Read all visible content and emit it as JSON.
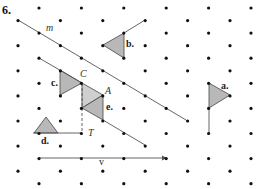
{
  "problem_number": "6.",
  "colors": {
    "dot": "#111111",
    "line": "#555555",
    "fill": "#b8b8b8",
    "fill_light": "#cfcfcf"
  },
  "grid": {
    "type": "isometric-dot",
    "x0_even": 39,
    "x0_odd": 18,
    "dx": 42.4,
    "y0": 8,
    "dy": 12.55,
    "rows": 15,
    "cols": 6
  },
  "lines": {
    "m": {
      "label": "m",
      "from": [
        18,
        20
      ],
      "to": [
        186,
        120
      ],
      "label_pos": [
        46,
        31
      ]
    },
    "c_line": {
      "from": [
        39,
        58
      ],
      "to": [
        82,
        83
      ]
    },
    "e_line": {
      "from": [
        103,
        120
      ],
      "to": [
        145,
        145
      ]
    },
    "b_line": {
      "from": [
        124,
        33
      ],
      "to": [
        145,
        20
      ]
    },
    "a_line": {
      "from": [
        209,
        108
      ],
      "to": [
        209,
        133
      ]
    },
    "d_line": {
      "from": [
        33,
        133
      ],
      "to": [
        82,
        133
      ]
    },
    "ct_dashed": {
      "from": [
        82,
        83
      ],
      "to": [
        82,
        133
      ]
    },
    "v": {
      "label": "v",
      "from": [
        39,
        158
      ],
      "to": [
        166,
        158
      ],
      "label_pos": [
        99,
        165
      ]
    }
  },
  "shapes": {
    "a": {
      "label": "a.",
      "points": [
        [
          209,
          83
        ],
        [
          230,
          95
        ],
        [
          209,
          108
        ]
      ],
      "label_pos": [
        221,
        89
      ]
    },
    "b": {
      "label": "b.",
      "points": [
        [
          103,
          45
        ],
        [
          124,
          33
        ],
        [
          124,
          58
        ]
      ],
      "label_pos": [
        126,
        47
      ]
    },
    "c": {
      "label": "c.",
      "points": [
        [
          60,
          70
        ],
        [
          82,
          83
        ],
        [
          60,
          95
        ]
      ],
      "label_pos": [
        51,
        86
      ]
    },
    "c_image": {
      "points": [
        [
          82,
          83
        ],
        [
          103,
          95
        ],
        [
          82,
          108
        ]
      ]
    },
    "d": {
      "label": "d.",
      "points": [
        [
          46,
          117
        ],
        [
          34,
          133
        ],
        [
          58,
          133
        ]
      ],
      "label_pos": [
        41,
        144
      ]
    },
    "e": {
      "label": "e.",
      "points": [
        [
          82,
          108
        ],
        [
          103,
          95
        ],
        [
          103,
          120
        ]
      ],
      "label_pos": [
        106,
        110
      ]
    }
  },
  "points": {
    "C": {
      "label": "C",
      "pos": [
        82,
        83
      ],
      "label_pos": [
        80,
        77
      ]
    },
    "A": {
      "label": "A",
      "pos": [
        103,
        95
      ],
      "label_pos": [
        105,
        94
      ]
    },
    "T": {
      "label": "T",
      "pos": [
        82,
        133
      ],
      "label_pos": [
        88,
        136
      ]
    }
  }
}
